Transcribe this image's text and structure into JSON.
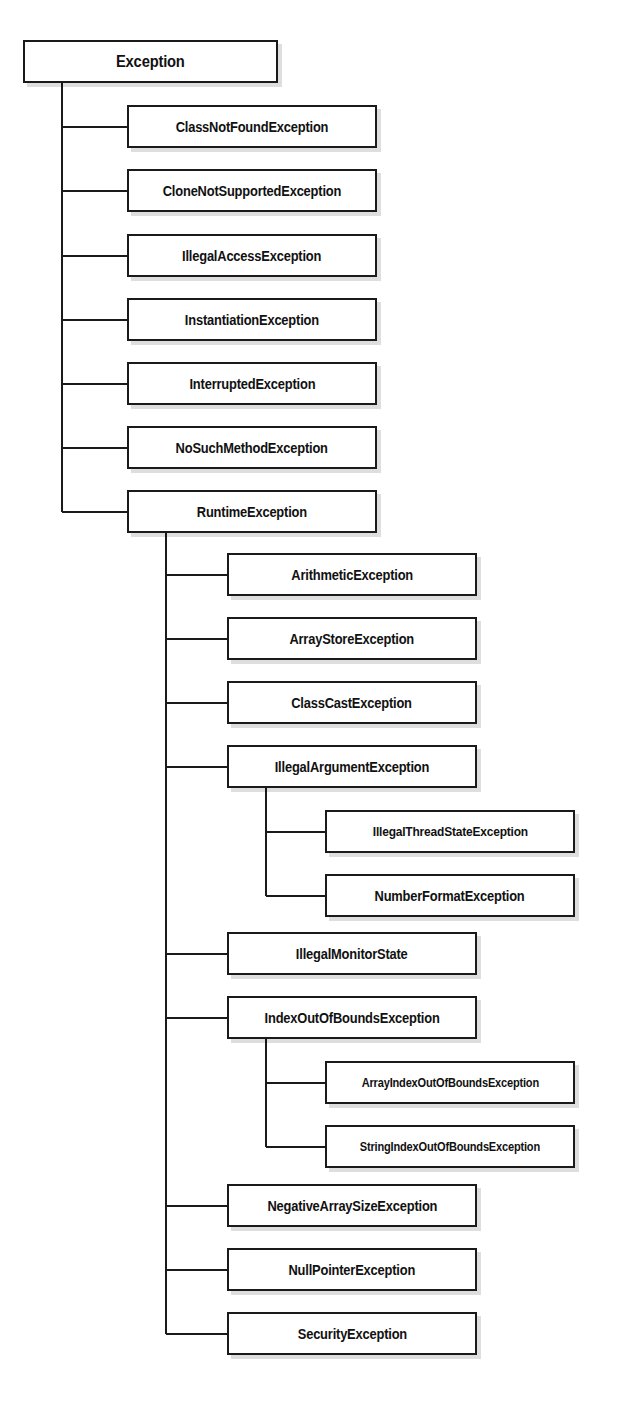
{
  "diagram": {
    "type": "class-hierarchy-tree",
    "line_color": "#1a1a1a",
    "box_fill": "#ffffff",
    "box_border": "#1a1a1a",
    "text_color": "#111111",
    "nodes": [
      {
        "id": "exception",
        "label": "Exception",
        "level": 0,
        "parent": null,
        "x": 23,
        "y": 40,
        "w": 255,
        "h": 43,
        "font": 16
      },
      {
        "id": "class-not-found",
        "label": "ClassNotFoundException",
        "level": 1,
        "parent": "exception",
        "x": 127,
        "y": 105,
        "w": 250,
        "h": 43,
        "font": 14
      },
      {
        "id": "clone-not-supported",
        "label": "CloneNotSupportedException",
        "level": 1,
        "parent": "exception",
        "x": 127,
        "y": 169,
        "w": 250,
        "h": 43,
        "font": 14
      },
      {
        "id": "illegal-access",
        "label": "IllegalAccessException",
        "level": 1,
        "parent": "exception",
        "x": 127,
        "y": 234,
        "w": 250,
        "h": 43,
        "font": 14
      },
      {
        "id": "instantiation",
        "label": "InstantiationException",
        "level": 1,
        "parent": "exception",
        "x": 127,
        "y": 298,
        "w": 250,
        "h": 43,
        "font": 14
      },
      {
        "id": "interrupted",
        "label": "InterruptedException",
        "level": 1,
        "parent": "exception",
        "x": 127,
        "y": 362,
        "w": 250,
        "h": 43,
        "font": 14
      },
      {
        "id": "no-such-method",
        "label": "NoSuchMethodException",
        "level": 1,
        "parent": "exception",
        "x": 127,
        "y": 426,
        "w": 250,
        "h": 43,
        "font": 14
      },
      {
        "id": "runtime",
        "label": "RuntimeException",
        "level": 1,
        "parent": "exception",
        "x": 127,
        "y": 490,
        "w": 250,
        "h": 43,
        "font": 14
      },
      {
        "id": "arithmetic",
        "label": "ArithmeticException",
        "level": 2,
        "parent": "runtime",
        "x": 227,
        "y": 553,
        "w": 250,
        "h": 43,
        "font": 14
      },
      {
        "id": "array-store",
        "label": "ArrayStoreException",
        "level": 2,
        "parent": "runtime",
        "x": 227,
        "y": 617,
        "w": 250,
        "h": 43,
        "font": 14
      },
      {
        "id": "class-cast",
        "label": "ClassCastException",
        "level": 2,
        "parent": "runtime",
        "x": 227,
        "y": 681,
        "w": 250,
        "h": 43,
        "font": 14
      },
      {
        "id": "illegal-argument",
        "label": "IllegalArgumentException",
        "level": 2,
        "parent": "runtime",
        "x": 227,
        "y": 745,
        "w": 250,
        "h": 43,
        "font": 14
      },
      {
        "id": "illegal-thread-state",
        "label": "IllegalThreadStateException",
        "level": 3,
        "parent": "illegal-argument",
        "x": 325,
        "y": 810,
        "w": 250,
        "h": 43,
        "font": 13
      },
      {
        "id": "number-format",
        "label": "NumberFormatException",
        "level": 3,
        "parent": "illegal-argument",
        "x": 325,
        "y": 874,
        "w": 250,
        "h": 43,
        "font": 14
      },
      {
        "id": "illegal-monitor-state",
        "label": "IllegalMonitorState",
        "level": 2,
        "parent": "runtime",
        "x": 227,
        "y": 932,
        "w": 250,
        "h": 43,
        "font": 14
      },
      {
        "id": "index-out-of-bounds",
        "label": "IndexOutOfBoundsException",
        "level": 2,
        "parent": "runtime",
        "x": 227,
        "y": 996,
        "w": 250,
        "h": 43,
        "font": 14
      },
      {
        "id": "array-index-out-of-bounds",
        "label": "ArrayIndexOutOfBoundsException",
        "level": 3,
        "parent": "index-out-of-bounds",
        "x": 325,
        "y": 1061,
        "w": 250,
        "h": 43,
        "font": 12
      },
      {
        "id": "string-index-out-of-bounds",
        "label": "StringIndexOutOfBoundsException",
        "level": 3,
        "parent": "index-out-of-bounds",
        "x": 325,
        "y": 1125,
        "w": 250,
        "h": 43,
        "font": 12
      },
      {
        "id": "negative-array-size",
        "label": "NegativeArraySizeException",
        "level": 2,
        "parent": "runtime",
        "x": 227,
        "y": 1184,
        "w": 250,
        "h": 43,
        "font": 14
      },
      {
        "id": "null-pointer",
        "label": "NullPointerException",
        "level": 2,
        "parent": "runtime",
        "x": 227,
        "y": 1248,
        "w": 250,
        "h": 43,
        "font": 14
      },
      {
        "id": "security",
        "label": "SecurityException",
        "level": 2,
        "parent": "runtime",
        "x": 227,
        "y": 1312,
        "w": 250,
        "h": 43,
        "font": 14
      }
    ],
    "connectors": {
      "exception_trunk_x": 62,
      "runtime_trunk_x": 162,
      "illegal_argument_trunk_x": 252,
      "index_out_of_bounds_trunk_x": 252
    }
  }
}
